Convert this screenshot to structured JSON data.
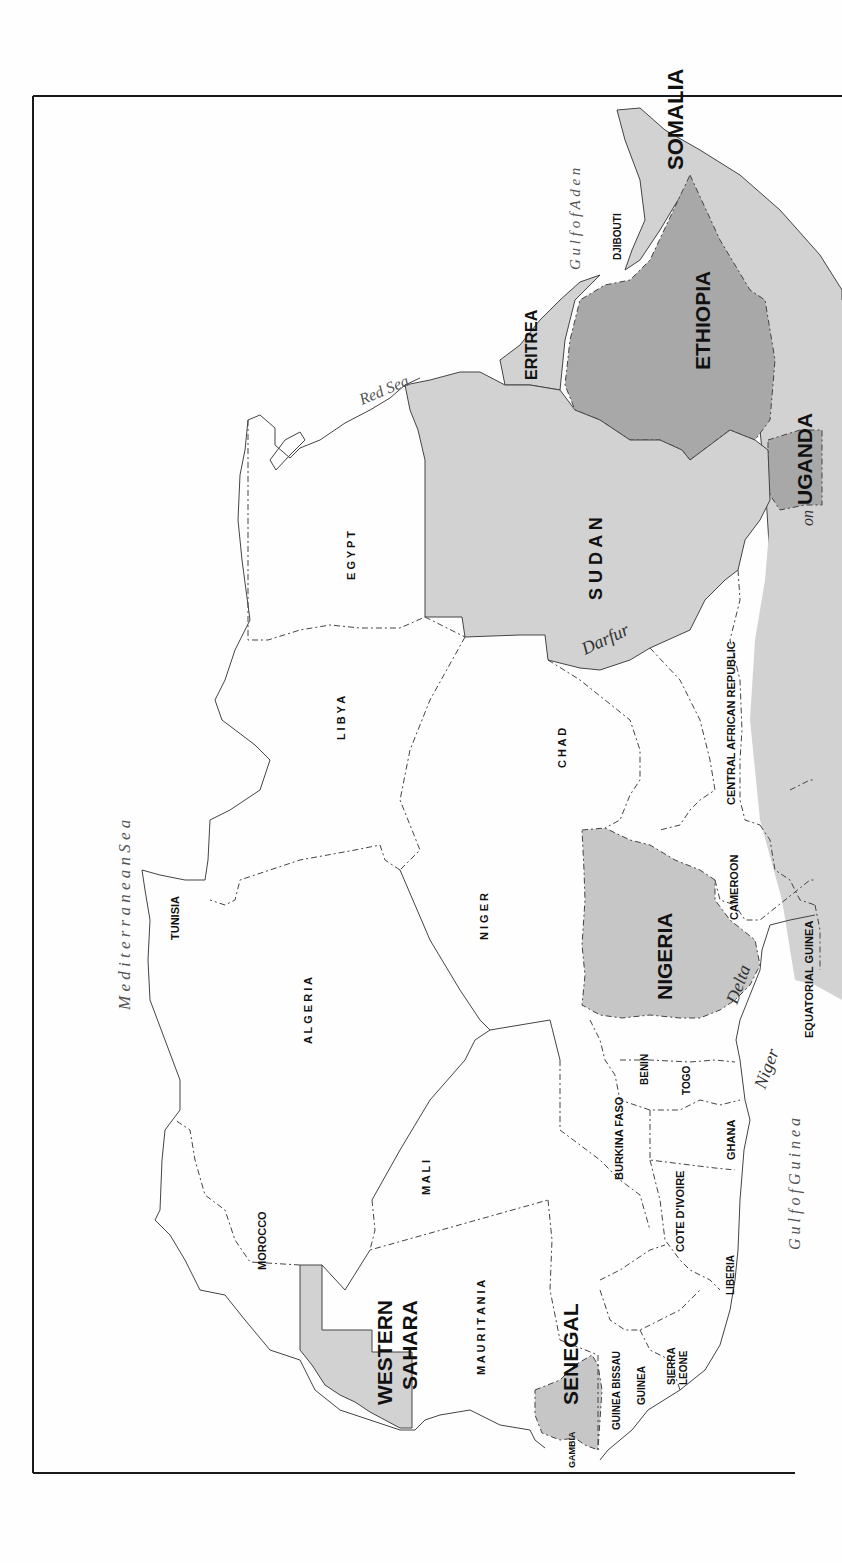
{
  "map": {
    "orientation": "rotated 90 degrees counter-clockwise (north to the left)",
    "colors": {
      "background": "#fefefe",
      "light_shade": "#d2d2d2",
      "dark_shade": "#a8a8a8",
      "unshaded": "#ffffff",
      "border": "#444444"
    },
    "seas": {
      "mediterranean": "M e d i t e r r a n e a n   S e a",
      "red_sea": "Red Sea",
      "gulf_of_aden": "G u l f  o f  A d e n",
      "gulf_of_guinea": "G u l f  o f  G u i n e a"
    },
    "regions": {
      "darfur": "Darfur",
      "niger_delta_niger": "Niger",
      "niger_delta_delta": "Delta",
      "uganda_partial": "uo"
    },
    "countries": {
      "somalia": "SOMALIA",
      "djibouti": "DJIBOUTI",
      "eritrea": "ERITREA",
      "ethiopia": "ETHIOPIA",
      "uganda": "UGANDA",
      "egypt": "E G Y P T",
      "sudan": "S U D A N",
      "libya": "L I B Y A",
      "chad": "C H A D",
      "car": "CENTRAL AFRICAN REPUBLIC",
      "tunisia": "TUNISIA",
      "algeria": "A L G E R I A",
      "niger": "N I G E R",
      "nigeria": "NIGERIA",
      "cameroon": "CAMEROON",
      "equatorial_guinea": "EQUATORIAL GUINEA",
      "morocco": "MOROCCO",
      "mali": "M A L I",
      "burkina_faso": "BURKINA FASO",
      "benin": "BENIN",
      "togo": "TOGO",
      "ghana": "GHANA",
      "cote_divoire": "COTE D'IVOIRE",
      "western_sahara_1": "WESTERN",
      "western_sahara_2": "SAHARA",
      "mauritania": "M A U R I T A N I A",
      "senegal": "SENEGAL",
      "gambia": "GAMBIA",
      "guinea_bissau": "GUINEA BISSAU",
      "guinea": "GUINEA",
      "sierra_leone_1": "SIERRA",
      "sierra_leone_2": "LEONE",
      "liberia": "LIBERIA"
    }
  }
}
